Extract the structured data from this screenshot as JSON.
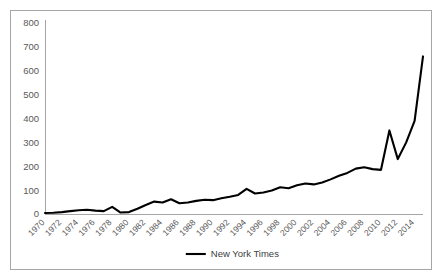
{
  "chart_data": {
    "type": "line",
    "title": "",
    "xlabel": "",
    "ylabel": "",
    "ylim": [
      0,
      800
    ],
    "ytick_values": [
      0,
      100,
      200,
      300,
      400,
      500,
      600,
      700,
      800
    ],
    "ytick_labels": [
      "0",
      "100",
      "200",
      "300",
      "400",
      "500",
      "600",
      "700",
      "800"
    ],
    "xlim": [
      1970,
      2015
    ],
    "xtick_labels": [
      "1970",
      "1972",
      "1974",
      "1976",
      "1978",
      "1980",
      "1982",
      "1984",
      "1986",
      "1988",
      "1990",
      "1992",
      "1994",
      "1996",
      "1998",
      "2000",
      "2002",
      "2004",
      "2006",
      "2008",
      "2010",
      "2012",
      "2014"
    ],
    "grid": false,
    "legend_position": "bottom-center",
    "series": [
      {
        "name": "New York Times",
        "color": "#000000",
        "x": [
          1970,
          1971,
          1972,
          1973,
          1974,
          1975,
          1976,
          1977,
          1978,
          1979,
          1980,
          1981,
          1982,
          1983,
          1984,
          1985,
          1986,
          1987,
          1988,
          1989,
          1990,
          1991,
          1992,
          1993,
          1994,
          1995,
          1996,
          1997,
          1998,
          1999,
          2000,
          2001,
          2002,
          2003,
          2004,
          2005,
          2006,
          2007,
          2008,
          2009,
          2010,
          2011,
          2012,
          2013,
          2014,
          2015
        ],
        "values": [
          4,
          5,
          8,
          12,
          16,
          18,
          14,
          12,
          30,
          6,
          8,
          22,
          38,
          52,
          48,
          62,
          45,
          48,
          55,
          60,
          58,
          66,
          72,
          80,
          105,
          86,
          90,
          98,
          112,
          108,
          120,
          128,
          124,
          132,
          145,
          160,
          172,
          190,
          196,
          188,
          185,
          350,
          230,
          300,
          390,
          660
        ]
      }
    ]
  },
  "legend": {
    "entries": [
      {
        "label": "New York Times",
        "color": "#000000"
      }
    ]
  }
}
